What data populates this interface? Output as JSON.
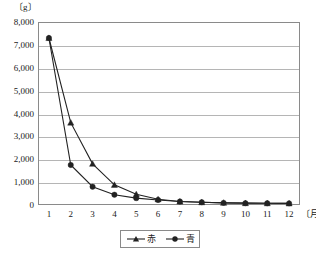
{
  "chart_data": {
    "type": "line",
    "title": "",
    "subtitle": "",
    "ylabel": "〔g〕",
    "xlabel": "〔月〕",
    "categories": [
      "1",
      "2",
      "3",
      "4",
      "5",
      "6",
      "7",
      "8",
      "9",
      "10",
      "11",
      "12"
    ],
    "ylim": [
      0,
      8000
    ],
    "ytick_labels": [
      "8,000",
      "7,000",
      "6,000",
      "5,000",
      "4,000",
      "3,000",
      "2,000",
      "1,000",
      "0"
    ],
    "ytick_values": [
      8000,
      7000,
      6000,
      5000,
      4000,
      3000,
      2000,
      1000,
      0
    ],
    "ytick_step": 1000,
    "grid": true,
    "grid_axis": "y",
    "legend_position": "bottom-center",
    "series": [
      {
        "name": "赤",
        "marker": "triangle",
        "color": "#222222",
        "values": [
          7300,
          3600,
          1800,
          880,
          470,
          250,
          150,
          120,
          95,
          80,
          75,
          70
        ]
      },
      {
        "name": "青",
        "marker": "circle",
        "color": "#222222",
        "values": [
          7300,
          1750,
          800,
          450,
          300,
          220,
          150,
          120,
          95,
          80,
          75,
          70
        ]
      }
    ]
  },
  "legend": {
    "items": [
      {
        "label": "赤",
        "marker": "triangle-marker-icon"
      },
      {
        "label": "青",
        "marker": "circle-marker-icon"
      }
    ]
  },
  "colors": {
    "frame": "#8a8a8a",
    "gridline": "#b5b5b5",
    "series_line": "#222222",
    "text": "#1a1a1a",
    "background": "#ffffff"
  }
}
